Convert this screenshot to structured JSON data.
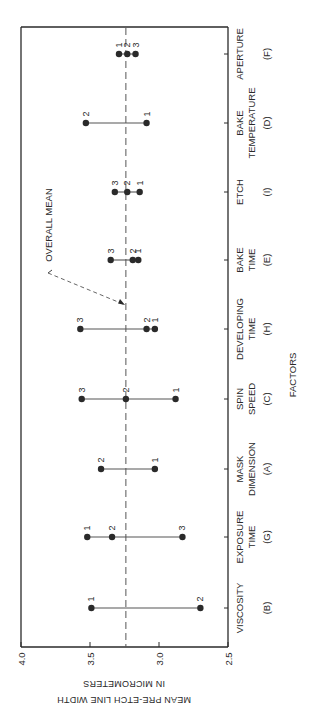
{
  "chart_data": {
    "type": "scatter",
    "subtype": "main-effects dot plot (rotated 90° counter-clockwise)",
    "title": "",
    "xlabel": "FACTORS",
    "ylabel": "MEAN PRE-ETCH LINE WIDTH IN MICROMETERS",
    "ylabel_lines": [
      "MEAN PRE-ETCH LINE WIDTH",
      "IN MICROMETERS"
    ],
    "ylim": [
      2.5,
      4.0
    ],
    "yticks": [
      4.0,
      3.5,
      3.0,
      2.5
    ],
    "ytick_labels": [
      "4.0",
      "3.5",
      "3.0",
      "2.5"
    ],
    "grid": false,
    "legend": null,
    "reference_line": {
      "label": "OVERALL MEAN",
      "value": 3.24,
      "style": "dashed"
    },
    "categories": [
      {
        "name": "VISCOSITY",
        "lines": [
          "VISCOSITY",
          "",
          "(B)"
        ],
        "code": "B",
        "levels": [
          {
            "level": "1",
            "value": 3.49
          },
          {
            "level": "2",
            "value": 2.7
          }
        ]
      },
      {
        "name": "EXPOSURE TIME",
        "lines": [
          "EXPOSURE",
          "TIME",
          "(G)"
        ],
        "code": "G",
        "levels": [
          {
            "level": "1",
            "value": 3.52
          },
          {
            "level": "2",
            "value": 3.34
          },
          {
            "level": "3",
            "value": 2.83
          }
        ]
      },
      {
        "name": "MASK DIMENSION",
        "lines": [
          "MASK",
          "DIMENSION",
          "(A)"
        ],
        "code": "A",
        "levels": [
          {
            "level": "2",
            "value": 3.42
          },
          {
            "level": "1",
            "value": 3.03
          }
        ]
      },
      {
        "name": "SPIN SPEED",
        "lines": [
          "SPIN",
          "SPEED",
          "(C)"
        ],
        "code": "C",
        "levels": [
          {
            "level": "3",
            "value": 3.56
          },
          {
            "level": "2",
            "value": 3.24
          },
          {
            "level": "1",
            "value": 2.88
          }
        ]
      },
      {
        "name": "DEVELOPING TIME",
        "lines": [
          "DEVELOPING",
          "TIME",
          "(H)"
        ],
        "code": "H",
        "levels": [
          {
            "level": "3",
            "value": 3.57
          },
          {
            "level": "2",
            "value": 3.09
          },
          {
            "level": "1",
            "value": 3.03
          }
        ]
      },
      {
        "name": "BAKE TIME",
        "lines": [
          "BAKE",
          "TIME",
          "(E)"
        ],
        "code": "E",
        "levels": [
          {
            "level": "3",
            "value": 3.35
          },
          {
            "level": "2",
            "value": 3.19
          },
          {
            "level": "1",
            "value": 3.15
          }
        ]
      },
      {
        "name": "ETCH",
        "lines": [
          "ETCH",
          "",
          "(I)"
        ],
        "code": "I",
        "levels": [
          {
            "level": "3",
            "value": 3.32
          },
          {
            "level": "2",
            "value": 3.23
          },
          {
            "level": "1",
            "value": 3.14
          }
        ]
      },
      {
        "name": "BAKE TEMPERATURE",
        "lines": [
          "BAKE",
          "TEMPERATURE",
          "(D)"
        ],
        "code": "D",
        "levels": [
          {
            "level": "2",
            "value": 3.53
          },
          {
            "level": "1",
            "value": 3.09
          }
        ]
      },
      {
        "name": "APERTURE",
        "lines": [
          "APERTURE",
          "",
          "(F)"
        ],
        "code": "F",
        "levels": [
          {
            "level": "1",
            "value": 3.29
          },
          {
            "level": "2",
            "value": 3.23
          },
          {
            "level": "3",
            "value": 3.17
          }
        ]
      }
    ]
  },
  "layout": {
    "frame": {
      "left": 21,
      "top": 27,
      "right": 228,
      "bottom": 647
    },
    "value_axis": {
      "v_max": 4.0,
      "x_at_max": 21,
      "px_per_unit": 138
    },
    "category_centers_y": [
      608,
      537,
      469,
      399,
      329,
      260,
      192,
      123,
      54
    ],
    "colors": {
      "ink": "#2a2a2a",
      "background": "#ffffff",
      "line": "#555555"
    }
  }
}
